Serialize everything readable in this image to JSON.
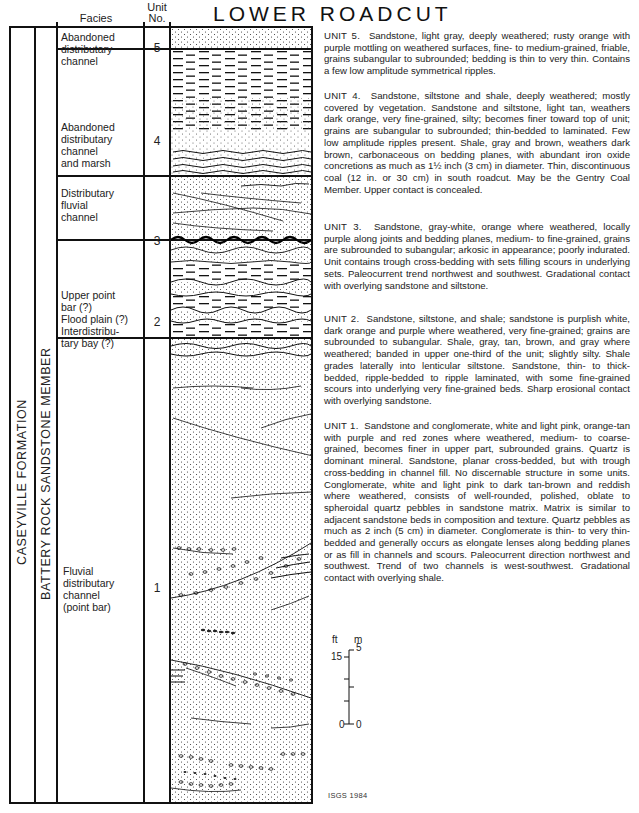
{
  "title": "LOWER ROADCUT",
  "headers": {
    "facies": "Facies",
    "unit_line1": "Unit",
    "unit_line2": "No."
  },
  "formation_label": "CASEYVILLE FORMATION",
  "member_label": "BATTERY ROCK SANDSTONE MEMBER",
  "units": [
    {
      "number": "5",
      "facies": [
        "Abandoned",
        "distributary",
        "channel"
      ],
      "lithology_pattern": "dotted-sandstone",
      "description_lead": "UNIT 5.",
      "description": "Sandstone, light gray, deeply weathered; rusty orange with purple mottling on weathered surfaces, fine- to medium-grained, friable, grains subangular to subrounded; bedding is thin to very thin. Contains a few low amplitude symmetrical ripples."
    },
    {
      "number": "4",
      "facies": [
        "Abandoned",
        "distributary",
        "channel",
        "and marsh"
      ],
      "lithology_pattern": "shale-siltstone-dashes",
      "description_lead": "UNIT 4.",
      "description": "Sandstone, siltstone and shale, deeply weathered; mostly covered by vegetation. Sandstone and siltstone, light tan, weathers dark orange, very fine-grained, silty; becomes finer toward top of unit; grains are subangular to subrounded; thin-bedded to laminated. Few low amplitude ripples present. Shale, gray and brown, weathers dark brown, carbonaceous on bedding planes, with abundant iron oxide concretions as much as 1½ inch (3 cm) in diameter. Thin, discontinuous coal (12 in. or 30 cm) in south roadcut. May be the Gentry Coal Member. Upper contact is concealed."
    },
    {
      "number": "3",
      "facies": [
        "Distributary",
        "fluvial",
        "channel"
      ],
      "lithology_pattern": "trough-cross-bedded-sandstone",
      "description_lead": "UNIT 3.",
      "description": "Sandstone, gray-white, orange where weathered, locally purple along joints and bedding planes, medium- to fine-grained, grains are subrounded to subangular; arkosic in appearance; poorly indurated. Unit contains trough cross-bedding with sets filling scours in underlying sets. Paleocurrent trend northwest and southwest. Gradational contact with overlying sandstone and siltstone."
    },
    {
      "number": "2",
      "facies": [
        "Upper point",
        "bar (?)",
        "Flood plain (?)",
        "Interdistribu-",
        "tary bay (?)"
      ],
      "lithology_pattern": "interbedded-sandstone-shale",
      "description_lead": "UNIT 2.",
      "description": "Sandstone, siltstone, and shale; sandstone is purplish white, dark orange and purple where weathered, very fine-grained; grains are subrounded to subangular. Shale, gray, tan, brown, and gray where weathered; banded in upper one-third of the unit; slightly silty. Shale grades laterally into lenticular siltstone. Sandstone, thin- to thick-bedded, ripple-bedded to ripple laminated, with some fine-grained scours into underlying very fine-grained beds. Sharp erosional contact with overlying sandstone."
    },
    {
      "number": "1",
      "facies": [
        "Fluvial",
        "distributary",
        "channel",
        "(point bar)"
      ],
      "lithology_pattern": "cross-bedded-sandstone-conglomerate",
      "description_lead": "UNIT 1.",
      "description": "Sandstone and conglomerate, white and light pink, orange-tan with purple and red zones where weathered, medium- to coarse-grained, becomes finer in upper part, subrounded grains. Quartz is dominant mineral. Sandstone, planar cross-bedded, but with trough cross-bedding in channel fill. No discernable structure in some units. Conglomerate, white and light pink to dark tan-brown and reddish where weathered, consists of well-rounded, polished, oblate to spheroidal quartz pebbles in sandstone matrix. Matrix is similar to adjacent sandstone beds in composition and texture. Quartz pebbles as much as 2 inch (5 cm) in diameter. Conglomerate is thin- to very thin-bedded and generally occurs as elongate lenses along bedding planes or as fill in channels and scours. Paleocurrent direction northwest and southwest. Trend of two channels is west-southwest. Gradational contact with overlying shale."
    }
  ],
  "scale_bar": {
    "ft_label": "ft",
    "m_label": "m",
    "ft_top": "15",
    "m_top": "5",
    "ft_bottom": "0",
    "m_bottom": "0"
  },
  "credit": "ISGS 1984"
}
